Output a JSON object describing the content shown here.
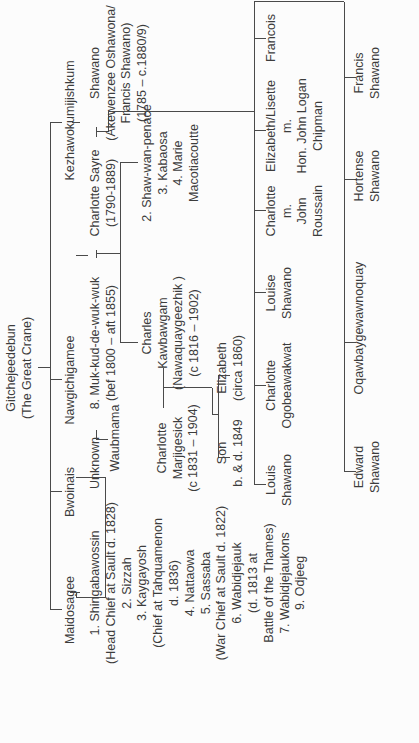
{
  "diagram": {
    "type": "family-tree",
    "orientation": "rotated-90-ccw",
    "root": {
      "id": "gitchejeedebun",
      "lines": [
        "Gitchejeedebun",
        "(The Great Crane)"
      ]
    },
    "generation1": [
      {
        "id": "maidosagee",
        "lines": [
          "Maidosagee"
        ]
      },
      {
        "id": "bwoinais",
        "lines": [
          "Bwoinais"
        ]
      },
      {
        "id": "nawgichigamee",
        "lines": [
          "Nawgichigamee"
        ]
      },
      {
        "id": "kezhawokumijishkum",
        "lines": [
          "Kezhawokumijishkum"
        ]
      }
    ],
    "maidosagee_children": {
      "id": "maidosagee-children",
      "lines": [
        "1. Shingabawossin",
        "(Head Chief at Sault d. 1828)",
        "2. Sizzah",
        "3. Kaygayosh",
        "(Chief at Tahquamenon",
        "d. 1836)",
        "4. Nattaowa",
        "5. Sassaba",
        "(War Chief at Sault d. 1822)",
        "6. Wabidjejauk",
        "(d. 1813 at",
        "Battle of the Thames)",
        "7. Wabidjejaukons",
        "9. Odjeeg"
      ]
    },
    "bwoinais_line": {
      "unknown": {
        "id": "unknown",
        "lines": [
          "Unknown"
        ]
      },
      "muk_kud": {
        "id": "muk-kud-de-wuk-wuk",
        "lines": [
          "8. Muk-kud-de-wuk-wuk",
          "(bef 1800 – aft 1855)"
        ]
      },
      "waubmama": {
        "id": "waubmama",
        "lines": [
          "Waubmama"
        ]
      }
    },
    "nawgichigamee_line": {
      "charlotte_sayre": {
        "id": "charlotte-sayre",
        "lines": [
          "Charlotte Sayre",
          "(1790-1889)"
        ]
      },
      "charles_kawbawgam": {
        "id": "charles-kawbawgam",
        "lines": [
          "Charles",
          "Kawbawgam",
          "(Nawaquaygeezhik )",
          "(c 1816 – 1902)"
        ]
      },
      "siblings": {
        "id": "sayre-siblings",
        "lines": [
          "2. Shaw-wan-penace",
          "3. Kabaosa",
          "4. Marie",
          "Macotiacoutte"
        ]
      },
      "charlotte_marjigesick": {
        "id": "charlotte-marjigesick",
        "lines": [
          "Charlotte",
          "Marjigesick",
          "(c 1831 – 1904)"
        ]
      },
      "son": {
        "id": "son",
        "lines": [
          "Son",
          "b. & d. 1849"
        ]
      },
      "elizabeth": {
        "id": "elizabeth",
        "lines": [
          "Elizabeth",
          "(circa 1860)"
        ]
      }
    },
    "kezhawokumijishkum_line": {
      "shawano": {
        "id": "shawano",
        "lines": [
          "Shawano",
          "(Akewenzee Oshawona/",
          "Francis Shawano)",
          "(1785 – c.1880/9)"
        ]
      },
      "children": [
        {
          "id": "louis-shawano",
          "lines": [
            "Louis",
            "Shawano"
          ]
        },
        {
          "id": "charlotte-ogobeawakwat",
          "lines": [
            "Charlotte",
            "Ogobeawakwat"
          ]
        },
        {
          "id": "louise-shawano",
          "lines": [
            "Louise",
            "Shawano"
          ]
        },
        {
          "id": "charlotte-roussain",
          "lines": [
            "Charlotte",
            "m.",
            "John",
            "Roussain"
          ]
        },
        {
          "id": "elizabeth-lisette",
          "lines": [
            "Elizabeth/Lisette",
            "m.",
            "Hon. John Logan",
            "Chipman"
          ]
        },
        {
          "id": "francois",
          "lines": [
            "Francois"
          ]
        }
      ],
      "grandchildren": [
        {
          "id": "edward-shawano",
          "lines": [
            "Edward",
            "Shawano"
          ]
        },
        {
          "id": "oqawbaygewawnoquay",
          "lines": [
            "Oqawbaygewawnoquay"
          ]
        },
        {
          "id": "hortense-shawano",
          "lines": [
            "Hortense",
            "Shawano"
          ]
        },
        {
          "id": "francis-shawano",
          "lines": [
            "Francis",
            "Shawano"
          ]
        }
      ]
    }
  },
  "colors": {
    "background": "#fcfcfc",
    "text": "#3c3c3c",
    "lines": "#4a4a4a"
  }
}
